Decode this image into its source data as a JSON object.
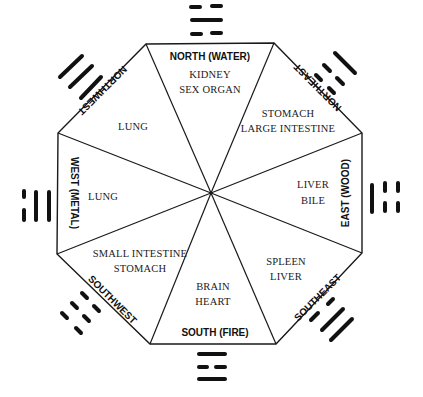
{
  "diagram": {
    "type": "bagua-octagon",
    "colors": {
      "ink": "#111111",
      "paper": "#ffffff"
    },
    "center": [
      211,
      193
    ],
    "vertices": [
      [
        146,
        44
      ],
      [
        274,
        43
      ],
      [
        362,
        133
      ],
      [
        362,
        253
      ],
      [
        276,
        344
      ],
      [
        150,
        344
      ],
      [
        57,
        254
      ],
      [
        58,
        133
      ]
    ],
    "sectors": [
      {
        "direction": "NORTH (WATER)",
        "organs": [
          "KIDNEY",
          "SEX ORGAN"
        ],
        "trigram": [
          "broken",
          "solid",
          "broken"
        ]
      },
      {
        "direction": "NORTHEAST",
        "organs": [
          "STOMACH",
          "LARGE INTESTINE"
        ],
        "trigram": [
          "broken",
          "broken",
          "solid"
        ]
      },
      {
        "direction": "EAST (WOOD)",
        "organs": [
          "LIVER",
          "BILE"
        ],
        "trigram": [
          "solid",
          "broken",
          "broken"
        ]
      },
      {
        "direction": "SOUTHEAST",
        "organs": [
          "SPLEEN",
          "LIVER"
        ],
        "trigram": [
          "broken",
          "solid",
          "solid"
        ]
      },
      {
        "direction": "SOUTH (FIRE)",
        "organs": [
          "BRAIN",
          "HEART"
        ],
        "trigram": [
          "solid",
          "broken",
          "solid"
        ]
      },
      {
        "direction": "SOUTHWEST",
        "organs": [
          "SMALL INTESTINE",
          "STOMACH"
        ],
        "trigram": [
          "broken",
          "broken",
          "broken"
        ]
      },
      {
        "direction": "WEST (METAL)",
        "organs": [
          "LUNG"
        ],
        "trigram": [
          "solid",
          "solid",
          "broken"
        ]
      },
      {
        "direction": "NORTHWEST",
        "organs": [
          "LUNG"
        ],
        "trigram": [
          "solid",
          "solid",
          "solid"
        ]
      }
    ]
  },
  "labels": {
    "north": {
      "direction": "NORTH (WATER)",
      "organ1": "KIDNEY",
      "organ2": "SEX ORGAN"
    },
    "northeast": {
      "direction": "NORTHEAST",
      "organ1": "STOMACH",
      "organ2": "LARGE INTESTINE"
    },
    "east": {
      "direction": "EAST (WOOD)",
      "organ1": "LIVER",
      "organ2": "BILE"
    },
    "southeast": {
      "direction": "SOUTHEAST",
      "organ1": "SPLEEN",
      "organ2": "LIVER"
    },
    "south": {
      "direction": "SOUTH (FIRE)",
      "organ1": "BRAIN",
      "organ2": "HEART"
    },
    "southwest": {
      "direction": "SOUTHWEST",
      "organ1": "SMALL INTESTINE",
      "organ2": "STOMACH"
    },
    "west": {
      "direction": "WEST (METAL)",
      "organ1": "LUNG"
    },
    "northwest": {
      "direction": "NORTHWEST",
      "organ1": "LUNG"
    }
  }
}
